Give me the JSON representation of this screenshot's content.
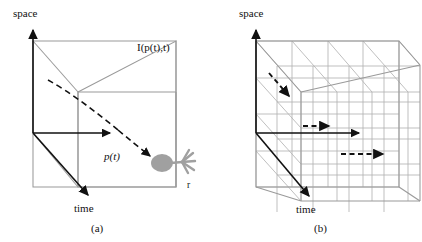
{
  "figure": {
    "title_present": false,
    "panels": [
      {
        "id": "a",
        "caption": "(a)",
        "axis_vertical_label": "space",
        "axis_depth_label": "time",
        "intensity_label": "I(p(t),t)",
        "path_label": "p(t)",
        "receptor_label": "r",
        "icons": {
          "space_axis_arrow": "arrow-up-icon",
          "time_axis_arrow": "arrow-down-right-icon",
          "flow_arrow": "arrow-right-icon",
          "trajectory_arrow": "dashed-arrow-icon",
          "receptor": "photoreceptor-icon"
        }
      },
      {
        "id": "b",
        "caption": "(b)",
        "axis_vertical_label": "space",
        "axis_depth_label": "time",
        "icons": {
          "space_axis_arrow": "arrow-up-icon",
          "time_axis_arrow": "arrow-down-right-icon",
          "flow_arrow": "arrow-right-icon",
          "dashed_arrow_upper": "dashed-arrow-diagonal-icon",
          "dashed_arrow_middle": "dashed-arrow-right-icon",
          "dashed_arrow_lower": "dashed-arrow-right-icon"
        }
      }
    ]
  },
  "colors": {
    "ink": "#111111",
    "cube_edge": "#9a9a9a",
    "grid_line": "#b4b4b4",
    "receptor_gray": "#a0a0a0",
    "background": "#ffffff"
  }
}
